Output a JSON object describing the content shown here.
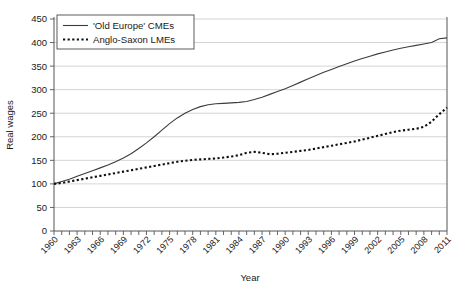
{
  "chart_data": {
    "type": "line",
    "title": "",
    "xlabel": "Year",
    "ylabel": "Real wages",
    "xlim": [
      1960,
      2011
    ],
    "ylim": [
      0,
      450
    ],
    "grid": true,
    "legend_position": "top-left",
    "ytick_labels": [
      "0",
      "50",
      "100",
      "150",
      "200",
      "250",
      "300",
      "350",
      "400",
      "450"
    ],
    "ytick_values": [
      0,
      50,
      100,
      150,
      200,
      250,
      300,
      350,
      400,
      450
    ],
    "xtick_labels": [
      "1960",
      "1963",
      "1966",
      "1969",
      "1972",
      "1975",
      "1978",
      "1981",
      "1984",
      "1987",
      "1990",
      "1993",
      "1996",
      "1999",
      "2002",
      "2005",
      "2008",
      "2011"
    ],
    "xtick_values": [
      1960,
      1963,
      1966,
      1969,
      1972,
      1975,
      1978,
      1981,
      1984,
      1987,
      1990,
      1993,
      1996,
      1999,
      2002,
      2005,
      2008,
      2011
    ],
    "x": [
      1960,
      1961,
      1962,
      1963,
      1964,
      1965,
      1966,
      1967,
      1968,
      1969,
      1970,
      1971,
      1972,
      1973,
      1974,
      1975,
      1976,
      1977,
      1978,
      1979,
      1980,
      1981,
      1982,
      1983,
      1984,
      1985,
      1986,
      1987,
      1988,
      1989,
      1990,
      1991,
      1992,
      1993,
      1994,
      1995,
      1996,
      1997,
      1998,
      1999,
      2000,
      2001,
      2002,
      2003,
      2004,
      2005,
      2006,
      2007,
      2008,
      2009,
      2010,
      2011
    ],
    "series": [
      {
        "name": "'Old Europe' CMEs",
        "style": "solid",
        "color": "#3c3c3c",
        "values": [
          100,
          105,
          110,
          116,
          122,
          128,
          134,
          140,
          147,
          155,
          164,
          175,
          187,
          200,
          214,
          228,
          240,
          250,
          258,
          264,
          268,
          270,
          271,
          272,
          273,
          275,
          279,
          284,
          290,
          296,
          302,
          309,
          316,
          323,
          330,
          337,
          343,
          349,
          355,
          361,
          366,
          371,
          376,
          380,
          384,
          388,
          391,
          394,
          397,
          400,
          408,
          410
        ]
      },
      {
        "name": "Anglo-Saxon LMEs",
        "style": "dotted",
        "color": "#111111",
        "values": [
          100,
          102,
          105,
          108,
          111,
          114,
          117,
          120,
          123,
          126,
          129,
          132,
          135,
          138,
          141,
          144,
          147,
          149,
          151,
          152,
          153,
          154,
          156,
          158,
          161,
          166,
          168,
          166,
          163,
          164,
          166,
          168,
          170,
          172,
          175,
          178,
          181,
          184,
          187,
          190,
          194,
          198,
          202,
          206,
          210,
          213,
          215,
          217,
          221,
          232,
          248,
          262
        ]
      }
    ],
    "annotations": [
      "Both series indexed to 100 in 1960",
      "CME curve plateaus around 1980-1985 near 270",
      "LME series dips around 1987-1988 then rises sharply after 2008"
    ]
  }
}
